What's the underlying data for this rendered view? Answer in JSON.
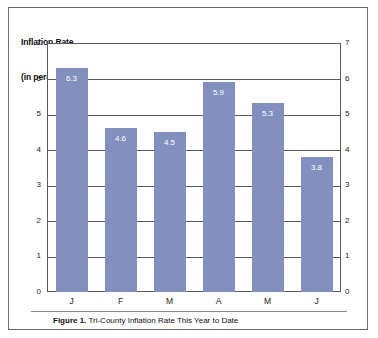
{
  "figure": {
    "axis_title_line1": "Inflation Rate",
    "axis_title_line2": "(in percent)",
    "caption_bold": "Figure 1.",
    "caption_rest": " Tri-County Inflation Rate This Year to Date",
    "bar_color": "#8190be",
    "border_color": "#6a6a6a",
    "grid_color": "#5a5a5a",
    "value_label_color": "#ffffff"
  },
  "axis": {
    "left_ticks": [
      "7",
      "6",
      "5",
      "4",
      "3",
      "2",
      "1",
      "0"
    ],
    "right_ticks": [
      "7",
      "6",
      "5",
      "4",
      "3",
      "2",
      "1",
      "0"
    ]
  },
  "chart_data": {
    "type": "bar",
    "title": "Inflation Rate (in percent)",
    "subtitle": "Figure 1. Tri-County Inflation Rate This Year to Date",
    "xlabel": "",
    "ylabel": "Inflation Rate (in percent)",
    "categories": [
      "J",
      "F",
      "M",
      "A",
      "M",
      "J"
    ],
    "values": [
      6.3,
      4.6,
      4.5,
      5.9,
      5.3,
      3.8
    ],
    "data_labels": [
      "6.3",
      "4.6",
      "4.5",
      "5.9",
      "5.3",
      "3.8"
    ],
    "ylim": [
      0,
      7
    ],
    "yticks": [
      0,
      1,
      2,
      3,
      4,
      5,
      6,
      7
    ],
    "grid": true,
    "legend": false,
    "series": [
      {
        "name": "Inflation Rate",
        "values": [
          6.3,
          4.6,
          4.5,
          5.9,
          5.3,
          3.8
        ],
        "color": "#8190be"
      }
    ]
  }
}
